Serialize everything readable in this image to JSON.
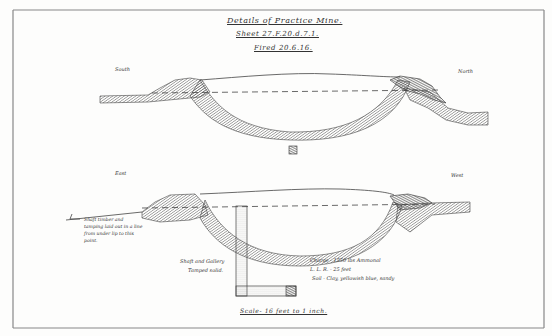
{
  "drawing": {
    "title": "Details of Practice Mine.",
    "sheet": "Sheet 27.F.20.d.7.1.",
    "fired": "Fired 20.6.16.",
    "scale": "Scale- 16 feet to 1 inch."
  },
  "upper_section": {
    "left_label": "South",
    "right_label": "North"
  },
  "lower_section": {
    "left_label": "East",
    "right_label": "West",
    "shaft_note": "Shaft timber and tamping laid out in a line from under lip to this point.",
    "shaft_label_line1": "Shaft and Gallery",
    "shaft_label_line2": "Tamped solid.",
    "charge": "Charge - 1550 lbs Ammonal",
    "llr": "L. L. R. - 25 feet",
    "soil": "Soil - Clay, yellowish blue, sandy"
  },
  "colors": {
    "ink": "#3a3a3a",
    "hatch": "#5a5a5a",
    "frame": "#777777",
    "paper": "#fdfdfc"
  }
}
